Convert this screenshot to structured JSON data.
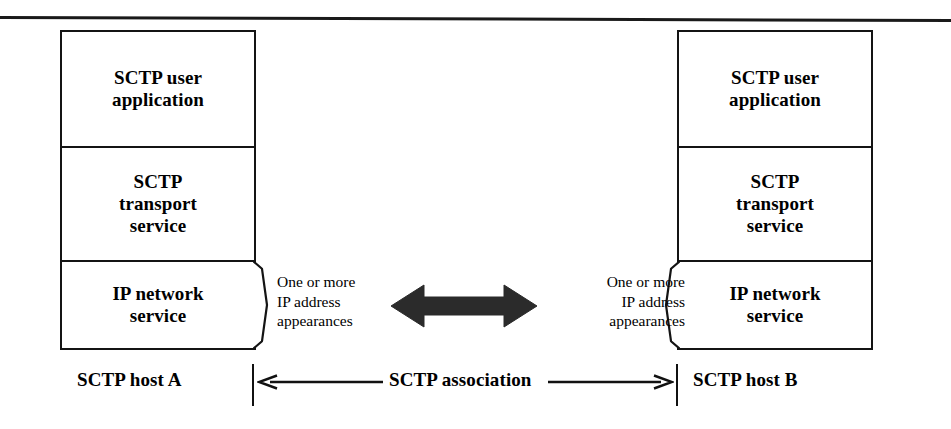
{
  "figure": {
    "type": "diagram",
    "colors": {
      "ink": "#111111",
      "background": "#ffffff",
      "arrow_fill": "#2b2b2b"
    }
  },
  "rule": {
    "name": "top-horizontal-rule"
  },
  "stacks": [
    {
      "side": "left",
      "host_label": "SCTP host A",
      "layers": [
        {
          "id": "application",
          "text": "SCTP user\napplication"
        },
        {
          "id": "transport",
          "text": "SCTP\ntransport\nservice"
        },
        {
          "id": "network",
          "text": "IP network\nservice"
        }
      ],
      "ip_note": "One or more\nIP address\nappearances"
    },
    {
      "side": "right",
      "host_label": "SCTP host B",
      "layers": [
        {
          "id": "application",
          "text": "SCTP user\napplication"
        },
        {
          "id": "transport",
          "text": "SCTP\ntransport\nservice"
        },
        {
          "id": "network",
          "text": "IP network\nservice"
        }
      ],
      "ip_note": "One or more\nIP address\nappearances"
    }
  ],
  "association": {
    "label": "SCTP association",
    "arrow_icon": "double-headed-horizontal-arrow",
    "left_arrow_icon": "arrow-left",
    "right_arrow_icon": "arrow-right",
    "bracket_icon": "vertical-tick"
  }
}
